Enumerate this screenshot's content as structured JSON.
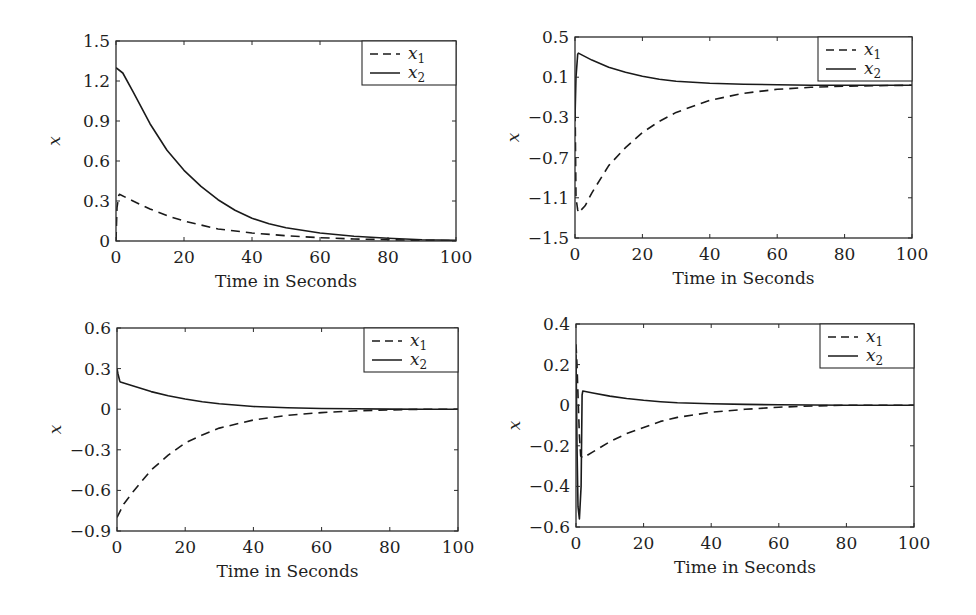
{
  "chart_data": [
    {
      "type": "line",
      "panel": "top-left",
      "box": {
        "x0": 116,
        "y0": 41,
        "x1": 456,
        "y1": 241
      },
      "xlabel": "Time in Seconds",
      "ylabel": "x",
      "xlim": [
        0,
        100
      ],
      "ylim": [
        0,
        1.5
      ],
      "xticks": [
        0,
        20,
        40,
        60,
        80,
        100
      ],
      "xtick_labels": [
        "0",
        "20",
        "40",
        "60",
        "80",
        "100"
      ],
      "yticks": [
        0,
        0.3,
        0.6,
        0.9,
        1.2,
        1.5
      ],
      "ytick_labels": [
        "0",
        "0.3",
        "0.6",
        "0.9",
        "1.2",
        "1.5"
      ],
      "grid": false,
      "legend": {
        "position": "upper-right",
        "entries": [
          "x1",
          "x2"
        ]
      },
      "series": [
        {
          "name": "x1",
          "style": "dashed",
          "x": [
            0,
            0.3,
            0.8,
            1,
            5,
            10,
            15,
            20,
            25,
            30,
            40,
            50,
            60,
            70,
            80,
            90,
            100
          ],
          "y": [
            0,
            0.25,
            0.34,
            0.35,
            0.3,
            0.24,
            0.19,
            0.15,
            0.12,
            0.09,
            0.06,
            0.04,
            0.025,
            0.015,
            0.01,
            0.005,
            0.003
          ]
        },
        {
          "name": "x2",
          "style": "solid",
          "x": [
            0,
            2,
            5,
            10,
            15,
            20,
            25,
            30,
            35,
            40,
            45,
            50,
            60,
            70,
            80,
            90,
            100
          ],
          "y": [
            1.3,
            1.26,
            1.12,
            0.88,
            0.68,
            0.53,
            0.41,
            0.31,
            0.23,
            0.17,
            0.13,
            0.1,
            0.06,
            0.035,
            0.02,
            0.01,
            0.005
          ]
        }
      ]
    },
    {
      "type": "line",
      "panel": "top-right",
      "box": {
        "x0": 575,
        "y0": 37,
        "x1": 912,
        "y1": 238
      },
      "xlabel": "Time in Seconds",
      "ylabel": "x",
      "xlim": [
        0,
        100
      ],
      "ylim": [
        -1.5,
        0.5
      ],
      "xticks": [
        0,
        20,
        40,
        60,
        80,
        100
      ],
      "xtick_labels": [
        "0",
        "20",
        "40",
        "60",
        "80",
        "100"
      ],
      "yticks": [
        -1.5,
        -1.1,
        -0.7,
        -0.3,
        0.1,
        0.5
      ],
      "ytick_labels": [
        "−1.5",
        "−1.1",
        "−0.7",
        "−0.3",
        "0.1",
        "0.5"
      ],
      "grid": false,
      "legend": {
        "position": "upper-right",
        "entries": [
          "x1",
          "x2"
        ]
      },
      "series": [
        {
          "name": "x1",
          "style": "dashed",
          "x": [
            0,
            0.3,
            0.8,
            1,
            3,
            5,
            10,
            15,
            20,
            25,
            30,
            40,
            50,
            60,
            70,
            80,
            90,
            100
          ],
          "y": [
            -0.1,
            -1.1,
            -1.22,
            -1.25,
            -1.18,
            -1.05,
            -0.78,
            -0.6,
            -0.45,
            -0.34,
            -0.25,
            -0.13,
            -0.06,
            -0.02,
            0.0,
            0.01,
            0.015,
            0.02
          ]
        },
        {
          "name": "x2",
          "style": "solid",
          "x": [
            0,
            0.3,
            0.8,
            1,
            5,
            10,
            15,
            20,
            25,
            30,
            40,
            50,
            60,
            70,
            80,
            90,
            100
          ],
          "y": [
            -0.3,
            0.1,
            0.33,
            0.34,
            0.27,
            0.2,
            0.15,
            0.11,
            0.08,
            0.06,
            0.04,
            0.03,
            0.025,
            0.02,
            0.02,
            0.02,
            0.02
          ]
        }
      ]
    },
    {
      "type": "line",
      "panel": "bottom-left",
      "box": {
        "x0": 117,
        "y0": 328,
        "x1": 458,
        "y1": 531
      },
      "xlabel": "Time in Seconds",
      "ylabel": "x",
      "xlim": [
        0,
        100
      ],
      "ylim": [
        -0.9,
        0.6
      ],
      "xticks": [
        0,
        20,
        40,
        60,
        80,
        100
      ],
      "xtick_labels": [
        "0",
        "20",
        "40",
        "60",
        "80",
        "100"
      ],
      "yticks": [
        -0.9,
        -0.6,
        -0.3,
        0,
        0.3,
        0.6
      ],
      "ytick_labels": [
        "−0.9",
        "−0.6",
        "−0.3",
        "0",
        "0.3",
        "0.6"
      ],
      "grid": false,
      "legend": {
        "position": "upper-right",
        "entries": [
          "x1",
          "x2"
        ]
      },
      "series": [
        {
          "name": "x1",
          "style": "dashed",
          "x": [
            0,
            2,
            5,
            10,
            15,
            20,
            25,
            30,
            40,
            50,
            60,
            70,
            80,
            90,
            100
          ],
          "y": [
            -0.8,
            -0.7,
            -0.6,
            -0.45,
            -0.34,
            -0.25,
            -0.19,
            -0.14,
            -0.08,
            -0.045,
            -0.025,
            -0.012,
            -0.005,
            0.0,
            0.0
          ]
        },
        {
          "name": "x2",
          "style": "solid",
          "x": [
            0,
            0.3,
            0.8,
            1,
            5,
            10,
            15,
            20,
            25,
            30,
            40,
            50,
            60,
            70,
            80,
            90,
            100
          ],
          "y": [
            0.3,
            0.26,
            0.21,
            0.2,
            0.17,
            0.13,
            0.1,
            0.075,
            0.055,
            0.04,
            0.02,
            0.01,
            0.005,
            0.003,
            0.001,
            0.0,
            0.0
          ]
        }
      ]
    },
    {
      "type": "line",
      "panel": "bottom-right",
      "box": {
        "x0": 576,
        "y0": 324,
        "x1": 914,
        "y1": 527
      },
      "xlabel": "Time in Seconds",
      "ylabel": "x",
      "xlim": [
        0,
        100
      ],
      "ylim": [
        -0.6,
        0.4
      ],
      "xticks": [
        0,
        20,
        40,
        60,
        80,
        100
      ],
      "xtick_labels": [
        "0",
        "20",
        "40",
        "60",
        "80",
        "100"
      ],
      "yticks": [
        -0.6,
        -0.4,
        -0.2,
        0,
        0.2,
        0.4
      ],
      "ytick_labels": [
        "−0.6",
        "−0.4",
        "−0.2",
        "0",
        "0.2",
        "0.4"
      ],
      "grid": false,
      "legend": {
        "position": "upper-right",
        "entries": [
          "x1",
          "x2"
        ]
      },
      "series": [
        {
          "name": "x1",
          "style": "dashed",
          "x": [
            0,
            0.3,
            0.6,
            1,
            1.4,
            2,
            5,
            10,
            15,
            20,
            25,
            30,
            40,
            50,
            60,
            70,
            80,
            90,
            100
          ],
          "y": [
            0.3,
            0.2,
            0.05,
            -0.15,
            -0.25,
            -0.26,
            -0.23,
            -0.18,
            -0.14,
            -0.11,
            -0.08,
            -0.06,
            -0.035,
            -0.02,
            -0.01,
            -0.004,
            0.0,
            0.0,
            0.0
          ]
        },
        {
          "name": "x2",
          "style": "solid",
          "x": [
            0,
            0.3,
            0.6,
            1,
            1.5,
            1.8,
            2,
            5,
            10,
            15,
            20,
            25,
            30,
            40,
            50,
            60,
            70,
            80,
            90,
            100
          ],
          "y": [
            0.25,
            -0.2,
            -0.5,
            -0.56,
            -0.4,
            0.05,
            0.07,
            0.06,
            0.045,
            0.033,
            0.024,
            0.017,
            0.012,
            0.007,
            0.004,
            0.002,
            0.001,
            0.0,
            0.0,
            0.0
          ]
        }
      ]
    }
  ],
  "colors": {
    "line": "#1a1a1a",
    "axis": "#2a2a2a",
    "background": "#ffffff"
  }
}
